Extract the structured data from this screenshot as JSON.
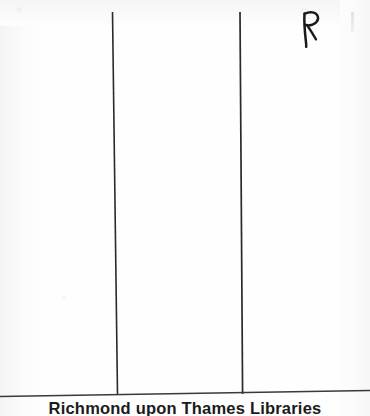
{
  "document": {
    "type": "scanned-page",
    "background_color": "#fdfdfd",
    "ink_color": "#1b1b1b"
  },
  "marks": {
    "handwritten_initial": "R",
    "handwritten_initial_label": "handwritten letter R in ink",
    "pencil_tick_label": "faint vertical pencil tick"
  },
  "rules": {
    "vertical_left_label": "left vertical ruled line",
    "vertical_right_label": "right vertical ruled line",
    "horizontal_label": "horizontal ruled baseline"
  },
  "stamp": {
    "text": "Richmond upon Thames Libraries",
    "clipped": "true"
  }
}
